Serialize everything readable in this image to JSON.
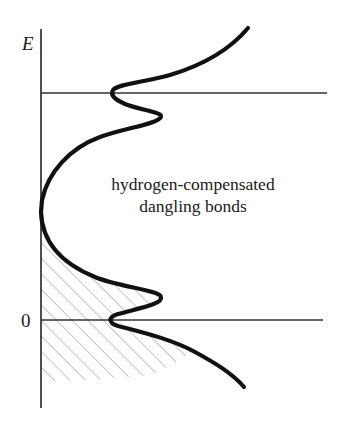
{
  "diagram": {
    "type": "density-of-states sketch",
    "axis": {
      "vertical_label": "E",
      "zero_label": "0"
    },
    "annotation": {
      "line1": "hydrogen-compensated",
      "line2": "dangling bonds"
    },
    "reference_lines": [
      {
        "name": "upper-level",
        "y_px": 93
      },
      {
        "name": "zero-level",
        "y_px": 320,
        "label": "0"
      }
    ],
    "shaded_region": "filled states below gap midpoint (diagonal hatching)",
    "colors": {
      "curve": "#111111",
      "axis": "#222222",
      "hatch": "#8a8a8a",
      "background": "#ffffff"
    }
  }
}
